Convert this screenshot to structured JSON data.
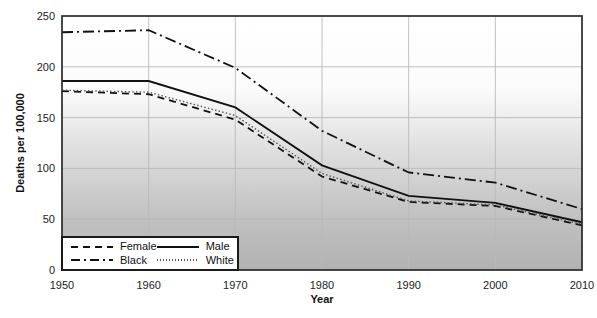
{
  "chart_data": {
    "type": "line",
    "title": "",
    "xlabel": "Year",
    "ylabel": "Deaths per 100,000",
    "x": [
      1950,
      1960,
      1970,
      1980,
      1990,
      2000,
      2010
    ],
    "xticks": [
      1950,
      1960,
      1970,
      1980,
      1990,
      2000,
      2010
    ],
    "yticks": [
      0,
      50,
      100,
      150,
      200,
      250
    ],
    "xlim": [
      1950,
      2010
    ],
    "ylim": [
      0,
      250
    ],
    "grid": true,
    "legend_position": "bottom-left-inside",
    "series": [
      {
        "name": "Female",
        "style": "dashed",
        "color": "#111111",
        "values": [
          176,
          173,
          148,
          92,
          67,
          63,
          44
        ]
      },
      {
        "name": "Black",
        "style": "dash-dot",
        "color": "#111111",
        "values": [
          234,
          236,
          199,
          137,
          96,
          86,
          60
        ]
      },
      {
        "name": "Male",
        "style": "solid",
        "color": "#111111",
        "values": [
          186,
          186,
          160,
          103,
          73,
          66,
          47
        ]
      },
      {
        "name": "White",
        "style": "dotted",
        "color": "#555555",
        "values": [
          177,
          175,
          152,
          95,
          68,
          64,
          45
        ]
      }
    ],
    "plot_background_gradient": [
      [
        "0%",
        "#ffffff"
      ],
      [
        "28%",
        "#fcfcfc"
      ],
      [
        "48%",
        "#e4e4e4"
      ],
      [
        "78%",
        "#c2c2c2"
      ],
      [
        "100%",
        "#b2b2b2"
      ]
    ],
    "grid_color": "#b9b9b9",
    "axis_color": "#2a2a2a",
    "tick_label_color": "#1c1c1c"
  }
}
